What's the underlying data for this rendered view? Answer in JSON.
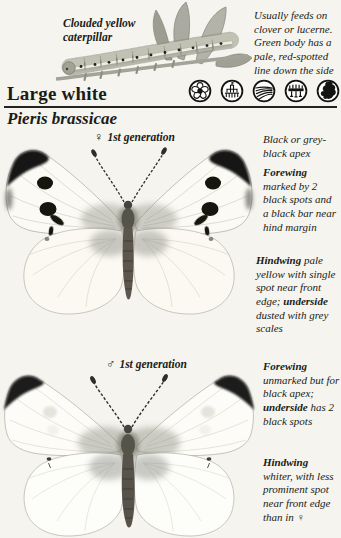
{
  "header": {
    "title": "Large white",
    "species": "Pieris brassicae",
    "habitat_icons": [
      "flower-icon",
      "building-garden-icon",
      "ploughed-field-icon",
      "fence-icon",
      "britain-distribution-map-icon"
    ]
  },
  "caterpillar": {
    "label": "Clouded yellow caterpillar",
    "note": "Usually feeds on clover or lucerne. Green body has a pale, red-spotted line down the side"
  },
  "female": {
    "symbol": "♀",
    "generation": "1st generation",
    "apex_note": "Black or grey-black apex",
    "forewing_note": [
      {
        "text": "Forewing",
        "bold": true
      },
      {
        "text": " marked by 2 black spots and a black bar near hind margin"
      }
    ],
    "hindwing_note": [
      {
        "text": "Hindwing",
        "bold": true
      },
      {
        "text": " pale yellow with single spot near front edge; "
      },
      {
        "text": "underside",
        "bold": true
      },
      {
        "text": " dusted with grey scales"
      }
    ]
  },
  "male": {
    "symbol": "♂",
    "generation": "1st generation",
    "forewing_note": [
      {
        "text": "Forewing",
        "bold": true
      },
      {
        "text": " unmarked but for black apex; "
      },
      {
        "text": "underside",
        "bold": true
      },
      {
        "text": " has 2 black spots"
      }
    ],
    "hindwing_note": [
      {
        "text": "Hindwing",
        "bold": true
      },
      {
        "text": " whiter, with less prominent spot near front edge than in ♀"
      }
    ]
  },
  "colors": {
    "paper": "#f5f4ee",
    "ink": "#1b1b17",
    "apex_black": "#191917",
    "wing_white": "#fbfaf4"
  }
}
